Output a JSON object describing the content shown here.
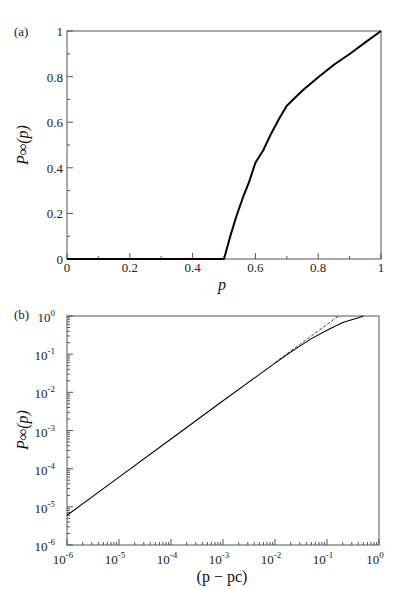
{
  "chart_data": [
    {
      "id": "a",
      "panel_label": "(a)",
      "type": "line",
      "title": "",
      "xlabel": "p",
      "ylabel": "P∞(p)",
      "xlim": [
        0,
        1
      ],
      "ylim": [
        0,
        1
      ],
      "x_scale": "linear",
      "y_scale": "linear",
      "x_ticks": [
        0,
        0.2,
        0.4,
        0.6,
        0.8,
        1
      ],
      "x_tick_labels": [
        "0",
        "0.2",
        "0.4",
        "0.6",
        "0.8",
        "1"
      ],
      "y_ticks": [
        0,
        0.2,
        0.4,
        0.6,
        0.8,
        1
      ],
      "y_tick_labels": [
        "0",
        "0.2",
        "0.4",
        "0.6",
        "0.8",
        "1"
      ],
      "grid": false,
      "legend": "none",
      "series": [
        {
          "name": "P∞(p)",
          "style": "solid-thick",
          "x": [
            0,
            0.1,
            0.2,
            0.3,
            0.4,
            0.5,
            0.52,
            0.54,
            0.56,
            0.58,
            0.6,
            0.625,
            0.65,
            0.675,
            0.7,
            0.75,
            0.8,
            0.85,
            0.9,
            0.95,
            1.0
          ],
          "y": [
            0,
            0,
            0,
            0,
            0,
            0,
            0.1002,
            0.1896,
            0.2687,
            0.3382,
            0.4222,
            0.4768,
            0.5497,
            0.6138,
            0.6719,
            0.7389,
            0.7969,
            0.8518,
            0.899,
            0.9499,
            1.0
          ]
        }
      ]
    },
    {
      "id": "b",
      "panel_label": "(b)",
      "type": "line",
      "title": "",
      "xlabel": "(p − pc)",
      "ylabel": "P∞(p)",
      "xlim": [
        1e-06,
        1
      ],
      "ylim": [
        1e-06,
        1
      ],
      "x_scale": "log",
      "y_scale": "log",
      "x_tick_exponents": [
        -6,
        -5,
        -4,
        -3,
        -2,
        -1,
        0
      ],
      "x_tick_labels": [
        "10^-6",
        "10^-5",
        "10^-4",
        "10^-3",
        "10^-2",
        "10^-1",
        "10^0"
      ],
      "y_tick_exponents": [
        -6,
        -5,
        -4,
        -3,
        -2,
        -1,
        0
      ],
      "y_tick_labels": [
        "10^-6",
        "10^-5",
        "10^-4",
        "10^-3",
        "10^-2",
        "10^-1",
        "10^0"
      ],
      "grid": false,
      "legend": "none",
      "series": [
        {
          "name": "P∞(p)",
          "style": "solid",
          "x": [
            1e-06,
            1e-05,
            0.0001,
            0.001,
            0.01,
            0.02,
            0.05,
            0.1,
            0.2,
            0.3,
            0.4,
            0.5
          ],
          "y": [
            6e-06,
            6e-05,
            0.0006,
            0.006,
            0.0583,
            0.1132,
            0.2555,
            0.4222,
            0.6719,
            0.7969,
            0.899,
            1.0
          ]
        },
        {
          "name": "power law fit",
          "style": "dashed",
          "x": [
            0.01,
            0.05,
            0.1,
            0.167
          ],
          "y": [
            0.06,
            0.3,
            0.6,
            1.0
          ]
        }
      ]
    }
  ]
}
